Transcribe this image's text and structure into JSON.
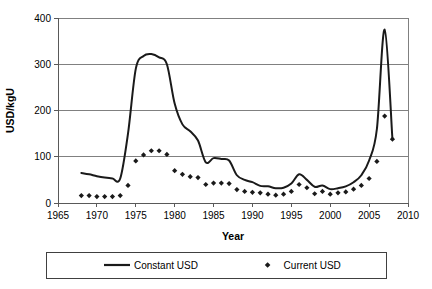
{
  "chart_data": {
    "type": "line",
    "title": "",
    "xlabel": "Year",
    "ylabel": "USD/kgU",
    "xlim": [
      1965,
      2010
    ],
    "ylim": [
      0,
      400
    ],
    "xticks": [
      1965,
      1970,
      1975,
      1980,
      1985,
      1990,
      1995,
      2000,
      2005,
      2010
    ],
    "yticks": [
      0,
      100,
      200,
      300,
      400
    ],
    "grid": "horizontal",
    "legend_position": "bottom",
    "series": [
      {
        "name": "Constant USD",
        "marker": "none",
        "style": "line",
        "x": [
          1968,
          1969,
          1970,
          1971,
          1972,
          1973,
          1974,
          1975,
          1976,
          1977,
          1978,
          1979,
          1980,
          1981,
          1982,
          1983,
          1984,
          1985,
          1986,
          1987,
          1988,
          1989,
          1990,
          1991,
          1992,
          1993,
          1994,
          1995,
          1996,
          1997,
          1998,
          1999,
          2000,
          2001,
          2002,
          2003,
          2004,
          2005,
          2006,
          2007,
          2008
        ],
        "values": [
          65,
          62,
          58,
          55,
          53,
          53,
          150,
          290,
          318,
          322,
          315,
          300,
          215,
          170,
          155,
          135,
          88,
          97,
          95,
          92,
          60,
          50,
          45,
          37,
          36,
          32,
          33,
          42,
          62,
          50,
          35,
          38,
          30,
          32,
          36,
          45,
          60,
          92,
          160,
          375,
          138
        ]
      },
      {
        "name": "Current USD",
        "marker": "diamond",
        "style": "markers",
        "x": [
          1968,
          1969,
          1970,
          1971,
          1972,
          1973,
          1974,
          1975,
          1976,
          1977,
          1978,
          1979,
          1980,
          1981,
          1982,
          1983,
          1984,
          1985,
          1986,
          1987,
          1988,
          1989,
          1990,
          1991,
          1992,
          1993,
          1994,
          1995,
          1996,
          1997,
          1998,
          1999,
          2000,
          2001,
          2002,
          2003,
          2004,
          2005,
          2006,
          2007,
          2008
        ],
        "values": [
          16,
          16,
          14,
          14,
          14,
          16,
          38,
          91,
          104,
          113,
          113,
          105,
          70,
          62,
          57,
          55,
          40,
          43,
          43,
          42,
          29,
          25,
          23,
          22,
          19,
          17,
          19,
          25,
          40,
          33,
          20,
          25,
          19,
          22,
          24,
          30,
          38,
          53,
          90,
          188,
          138
        ]
      }
    ]
  },
  "axes": {
    "y_title": "USD/kgU",
    "x_title": "Year",
    "y_tick_labels": [
      "0",
      "100",
      "200",
      "300",
      "400"
    ],
    "x_tick_labels": [
      "1965",
      "1970",
      "1975",
      "1980",
      "1985",
      "1990",
      "1995",
      "2000",
      "2005",
      "2010"
    ]
  },
  "legend": {
    "items": [
      {
        "label": "Constant USD",
        "symbol": "line"
      },
      {
        "label": "Current USD",
        "symbol": "diamond"
      }
    ]
  },
  "colors": {
    "series": "#1a1a1a",
    "grid": "#808080",
    "axis": "#595959",
    "background": "#ffffff"
  }
}
